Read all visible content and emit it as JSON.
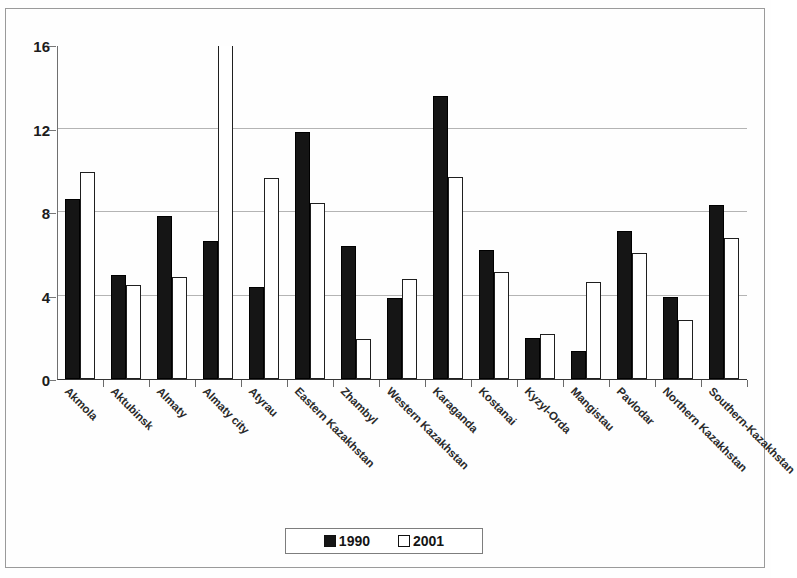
{
  "chart_data": {
    "type": "bar",
    "title": "",
    "subtitle": "",
    "xlabel": "",
    "ylabel": "",
    "ylim": [
      0,
      16
    ],
    "yticks": [
      0,
      4,
      8,
      12,
      16
    ],
    "grid": true,
    "legend_position": "bottom",
    "note": "The 2001 bar for 'Almaty city' exceeds the axis maximum and is clipped at the top of the plot area.",
    "categories": [
      "Akmola",
      "Aktubinsk",
      "Almaty",
      "Almaty city",
      "Atyrau",
      "Eastern Kazakhstan",
      "Zhambyl",
      "Western Kazakhstan",
      "Karaganda",
      "Kostanai",
      "Kyzyl-Orda",
      "Mangistau",
      "Pavlodar",
      "Northern Kazakhstan",
      "Southern-Kazakhstan"
    ],
    "series": [
      {
        "name": "1990",
        "color": "#151515",
        "values": [
          8.6,
          5.0,
          7.8,
          6.6,
          4.4,
          11.85,
          6.35,
          3.9,
          13.55,
          6.2,
          1.95,
          1.35,
          7.1,
          3.95,
          8.35
        ]
      },
      {
        "name": "2001",
        "color": "#ffffff",
        "values": [
          9.9,
          4.5,
          4.9,
          17.2,
          9.65,
          8.45,
          1.9,
          4.8,
          9.7,
          5.15,
          2.15,
          4.65,
          6.05,
          2.85,
          6.75
        ]
      }
    ]
  },
  "legend": {
    "items": [
      {
        "label": "1990",
        "swatch": "filled-square-icon"
      },
      {
        "label": "2001",
        "swatch": "empty-square-icon"
      }
    ]
  }
}
